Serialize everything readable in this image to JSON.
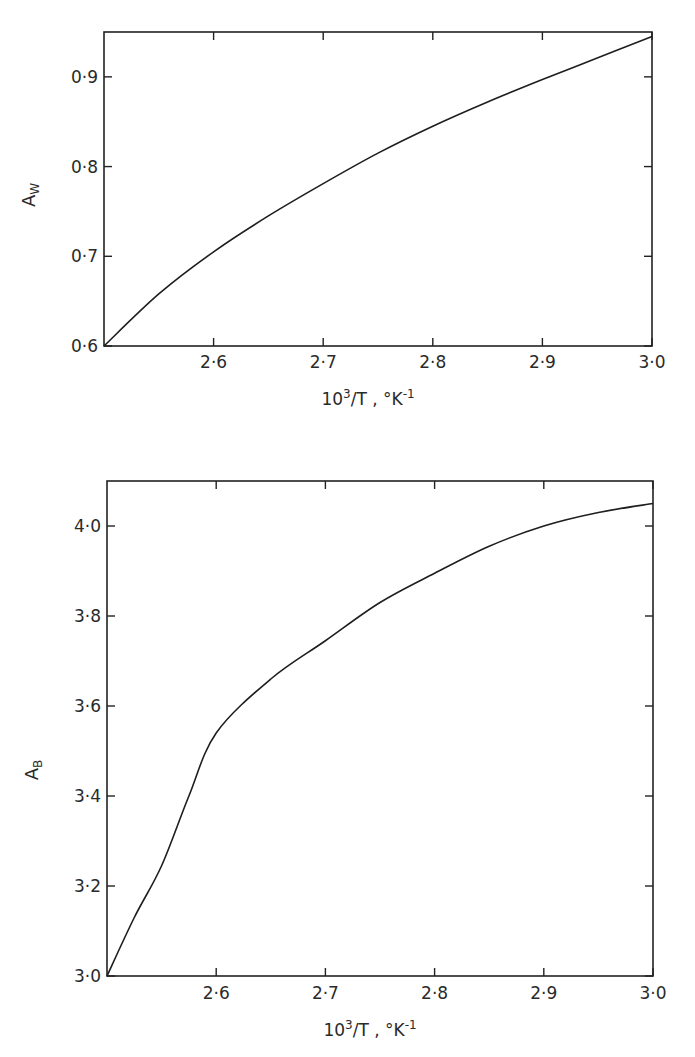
{
  "chart_data": [
    {
      "type": "line",
      "title": "",
      "xlabel": "10^3/T , °K^-1",
      "xlabel_parts": {
        "base": "10",
        "exp": "3",
        "rest": "/T  ,  °K",
        "exp2": "-1"
      },
      "ylabel": "A_W",
      "ylabel_parts": {
        "main": "A",
        "sub": "W"
      },
      "xlim": [
        2.5,
        3.0
      ],
      "ylim": [
        0.6,
        0.95
      ],
      "x_ticks": [
        2.6,
        2.7,
        2.8,
        2.9,
        3.0
      ],
      "x_tick_labels": [
        "2·6",
        "2·7",
        "2·8",
        "2·9",
        "3·0"
      ],
      "y_ticks": [
        0.6,
        0.7,
        0.8,
        0.9
      ],
      "y_tick_labels": [
        "0·6",
        "0·7",
        "0·8",
        "0·9"
      ],
      "grid": false,
      "legend": null,
      "series": [
        {
          "name": "A_W",
          "x": [
            2.5,
            2.55,
            2.6,
            2.65,
            2.7,
            2.75,
            2.8,
            2.85,
            2.9,
            2.95,
            3.0
          ],
          "y": [
            0.6,
            0.658,
            0.705,
            0.745,
            0.781,
            0.815,
            0.845,
            0.872,
            0.897,
            0.921,
            0.945
          ]
        }
      ]
    },
    {
      "type": "line",
      "title": "",
      "xlabel": "10^3/T , °K^-1",
      "xlabel_parts": {
        "base": "10",
        "exp": "3",
        "rest": "/T  ,  °K",
        "exp2": "-1"
      },
      "ylabel": "A_B",
      "ylabel_parts": {
        "main": "A",
        "sub": "B"
      },
      "xlim": [
        2.5,
        3.0
      ],
      "ylim": [
        3.0,
        4.1
      ],
      "x_ticks": [
        2.6,
        2.7,
        2.8,
        2.9,
        3.0
      ],
      "x_tick_labels": [
        "2·6",
        "2·7",
        "2·8",
        "2·9",
        "3·0"
      ],
      "y_ticks": [
        3.0,
        3.2,
        3.4,
        3.6,
        3.8,
        4.0
      ],
      "y_tick_labels": [
        "3·0",
        "3·2",
        "3·4",
        "3·6",
        "3·8",
        "4·0"
      ],
      "grid": false,
      "legend": null,
      "series": [
        {
          "name": "A_B",
          "x": [
            2.5,
            2.525,
            2.55,
            2.575,
            2.6,
            2.65,
            2.7,
            2.75,
            2.8,
            2.85,
            2.9,
            2.95,
            3.0
          ],
          "y": [
            3.0,
            3.13,
            3.245,
            3.4,
            3.54,
            3.66,
            3.745,
            3.83,
            3.895,
            3.955,
            4.0,
            4.03,
            4.05
          ]
        }
      ]
    }
  ],
  "layout": {
    "panels": [
      {
        "left": 104,
        "top": 32,
        "right": 652,
        "bottom": 346,
        "ylabel_x": 35,
        "ylabel_y": 195,
        "ticklabel_y": 368,
        "xtitle_y": 405
      },
      {
        "left": 107,
        "top": 481,
        "right": 653,
        "bottom": 976,
        "ylabel_x": 38,
        "ylabel_y": 770,
        "ticklabel_y": 999,
        "xtitle_y": 1036
      }
    ],
    "line_color": "#1e1e1e"
  }
}
